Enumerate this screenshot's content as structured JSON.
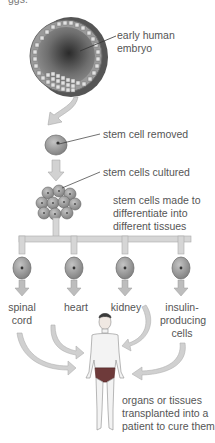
{
  "diagram": {
    "title_cutoff": "ggs.",
    "type": "process-flow",
    "colors": {
      "background": "#ffffff",
      "arrow_fill": "#c9c9c9",
      "arrow_stroke": "#a8a8a8",
      "cell_fill": "#a9a9a9",
      "cell_dark": "#6a6a6a",
      "embryo_dark": "#3a3a3a",
      "text": "#555555",
      "leader_line": "#333333"
    },
    "steps": {
      "embryo": {
        "label_line1": "early human",
        "label_line2": "embryo"
      },
      "removed": {
        "label": "stem cell removed"
      },
      "cultured": {
        "label": "stem cells cultured"
      },
      "differentiate": {
        "label_line1": "stem cells made to",
        "label_line2": "differentiate into",
        "label_line3": "different tissues"
      },
      "tissues": [
        {
          "line1": "spinal",
          "line2": "cord"
        },
        {
          "line1": "heart",
          "line2": ""
        },
        {
          "line1": "kidney",
          "line2": ""
        },
        {
          "line1": "insulin-",
          "line2": "producing",
          "line3": "cells"
        }
      ],
      "transplant": {
        "label_line1": "organs or tissues",
        "label_line2": "transplanted into a",
        "label_line3": "patient to cure them"
      }
    }
  }
}
